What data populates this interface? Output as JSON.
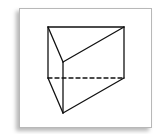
{
  "diagram": {
    "type": "triangular-prism",
    "colors": {
      "stroke": "#111111",
      "card_background": "#ffffff",
      "card_border": "#b8b8b8"
    },
    "vertices": {
      "top_back_left": [
        48,
        27
      ],
      "top_back_right": [
        124,
        27
      ],
      "top_front": [
        63,
        62
      ],
      "bottom_back_left": [
        48,
        78
      ],
      "bottom_back_right": [
        124,
        78
      ],
      "bottom_front": [
        63,
        113
      ]
    },
    "hidden_edges": [
      [
        "bottom_back_left",
        "bottom_back_right"
      ]
    ]
  }
}
